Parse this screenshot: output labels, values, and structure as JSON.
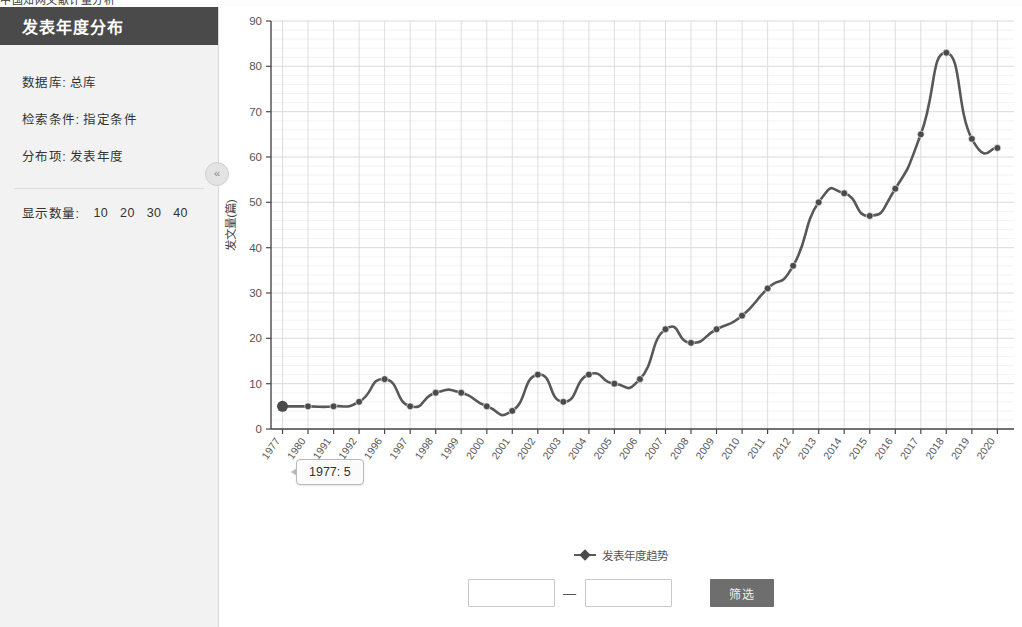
{
  "top_strip": {
    "cut_text": "中国知网文献计量分析"
  },
  "sidebar": {
    "title": "发表年度分布",
    "info": [
      {
        "key": "数据库:",
        "value": "总库"
      },
      {
        "key": "检索条件:",
        "value": "指定条件"
      },
      {
        "key": "分布项:",
        "value": "发表年度"
      }
    ],
    "count_label": "显示数量:",
    "count_options": [
      "10",
      "20",
      "30",
      "40"
    ],
    "collapse_icon": "chevron-double-left-icon"
  },
  "chart_data": {
    "type": "line",
    "title": "",
    "xlabel": "",
    "ylabel": "发文量(篇)",
    "ylim": [
      0,
      90
    ],
    "ytick_step": 10,
    "yticks": [
      0,
      10,
      20,
      30,
      40,
      50,
      60,
      70,
      80,
      90
    ],
    "grid": true,
    "legend_position": "bottom",
    "legend": [
      "发表年度趋势"
    ],
    "series_name": "发表年度趋势",
    "line_color": "#585858",
    "marker_color": "#4a4a4a",
    "categories": [
      "1977",
      "1980",
      "1991",
      "1992",
      "1996",
      "1997",
      "1998",
      "1999",
      "2000",
      "2001",
      "2002",
      "2003",
      "2004",
      "2005",
      "2006",
      "2007",
      "2008",
      "2009",
      "2010",
      "2011",
      "2012",
      "2013",
      "2014",
      "2015",
      "2016",
      "2017",
      "2018",
      "2019",
      "2020"
    ],
    "values": [
      5,
      5,
      5,
      6,
      11,
      5,
      8,
      8,
      5,
      4,
      12,
      6,
      12,
      10,
      11,
      22,
      19,
      22,
      25,
      31,
      36,
      50,
      52,
      47,
      53,
      65,
      83,
      64,
      62
    ],
    "annotations": [
      {
        "label": "1977: 5",
        "x": "1977",
        "y": 5
      }
    ]
  },
  "tooltip": {
    "text": "1977: 5"
  },
  "filter": {
    "start_placeholder": "",
    "start_value": "",
    "end_placeholder": "",
    "end_value": "",
    "dash": "—",
    "button_label": "筛选"
  }
}
